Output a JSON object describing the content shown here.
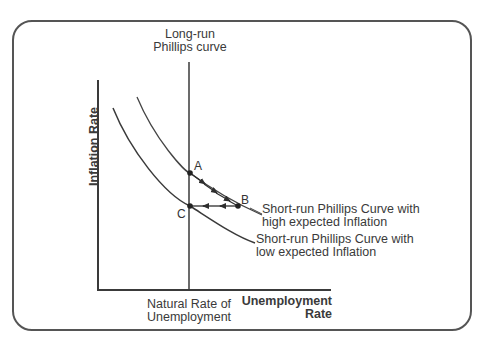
{
  "diagram": {
    "title": "",
    "axes": {
      "y_label": "Inflation Rate",
      "x_label_line1": "Unemployment",
      "x_label_line2": "Rate"
    },
    "long_run_curve": {
      "label_line1": "Long-run",
      "label_line2": "Phillips curve"
    },
    "natural_rate": {
      "label_line1": "Natural Rate of",
      "label_line2": "Unemployment"
    },
    "short_run_high": {
      "label_line1": "Short-run Phillips Curve with",
      "label_line2": "high expected Inflation"
    },
    "short_run_low": {
      "label_line1": "Short-run Phillips Curve with",
      "label_line2": "low expected Inflation"
    },
    "points": [
      {
        "id": "A",
        "label": "A"
      },
      {
        "id": "B",
        "label": "B"
      },
      {
        "id": "C",
        "label": "C"
      }
    ],
    "movement": [
      "A → B along high-expectation short-run curve",
      "B → C back to long-run curve"
    ],
    "colors": {
      "line": "#3a3a3a",
      "frame": "#555555",
      "background": "#ffffff"
    }
  }
}
